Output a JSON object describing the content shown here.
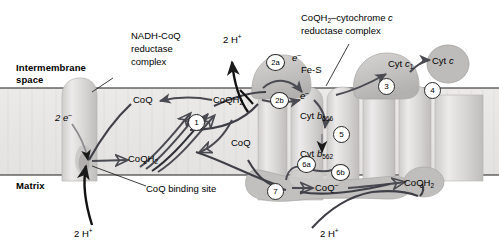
{
  "figure": {
    "type": "diagram",
    "background_color": "#ffffff",
    "membrane_fill": "#e8e6e4",
    "complex_fill": "#c9c7c5",
    "arrow_color": "#4a4a52"
  },
  "compartments": {
    "top_label": "Intermembrane",
    "top_label_2": "space",
    "bottom_label": "Matrix"
  },
  "complex_titles": {
    "left": {
      "line1": "NADH-CoQ",
      "line2": "reductase",
      "line3": "complex"
    },
    "right": {
      "line1_a": "CoQH",
      "line1_sub": "2",
      "line1_b": "–cytochrome ",
      "line1_it": "c",
      "line2": "reductase complex"
    }
  },
  "species": {
    "coq": "CoQ",
    "coqh2_a": "CoQH",
    "coqh2_sub": "2",
    "coq_radical_a": "CoQ",
    "coq_radical_sup": "–",
    "two_electrons": "2 e",
    "two_electrons_sup": "–",
    "electron": "e",
    "electron_sup": "–",
    "two_protons": "2 H",
    "two_protons_sup": "+",
    "fe_s": "Fe-S",
    "cyt_c1_a": "Cyt ",
    "cyt_c1_it": "c",
    "cyt_c1_sub": "1",
    "cyt_c_a": "Cyt ",
    "cyt_c_it": "c",
    "cyt_b566_a": "Cyt ",
    "cyt_b566_it": "b",
    "cyt_b566_sub": "566",
    "cyt_b562_a": "Cyt ",
    "cyt_b562_it": "b",
    "cyt_b562_sub": "562",
    "binding_site": "CoQ binding site"
  },
  "step_numbers": {
    "one": "1",
    "two_a": "2a",
    "two_b": "2b",
    "three": "3",
    "four": "4",
    "five": "5",
    "six_a": "6a",
    "six_b": "6b",
    "seven": "7"
  },
  "labels": {
    "coq_top_left": "CoQ",
    "coqh2_mid_top": "CoQH2",
    "coq_mid_right": "CoQ",
    "coqh2_mid_left": "CoQH2",
    "two_e_left": "2 e-",
    "two_h_bottom_left": "2 H+",
    "two_h_top": "2 H+",
    "two_h_bottom_right": "2 H+",
    "coq_radical_bottom": "CoQ-",
    "coqh2_bottom_right": "CoQH2"
  }
}
